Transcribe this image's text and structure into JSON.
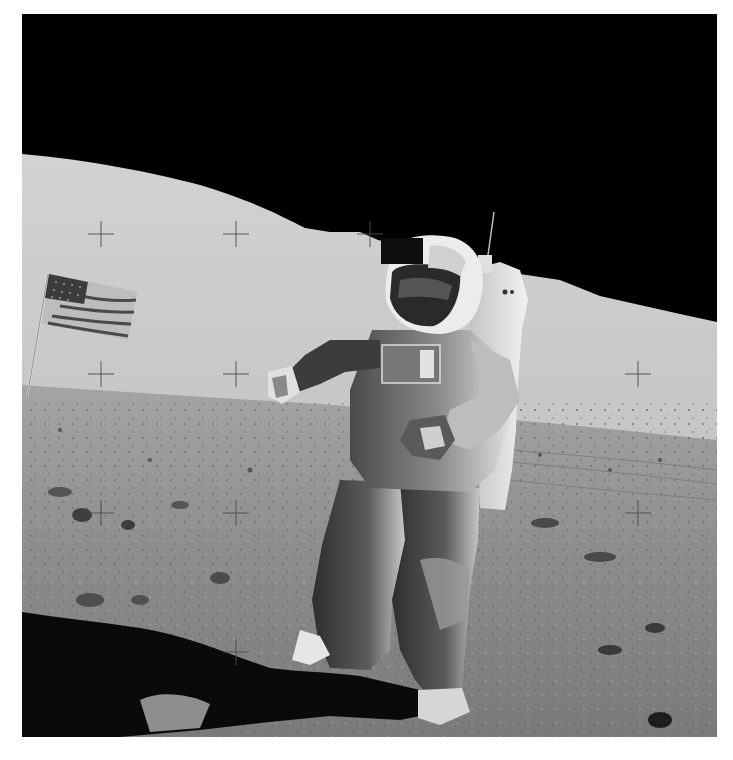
{
  "image": {
    "subject": "Astronaut on lunar surface",
    "description": "Black-and-white photograph of an astronaut in a spacesuit with backpack standing on the Moon, an American flag on a pole to the left, hills on the horizon, black sky, reseau crosshair marks across the frame",
    "frame": {
      "x": 22,
      "y": 14,
      "width": 695,
      "height": 723,
      "border_color": "#ffffff"
    },
    "colors": {
      "sky": "#000000",
      "hill_light": "#cfcfcf",
      "hill_mid": "#b8b8b8",
      "ground": "#8a8a8a",
      "ground_dark": "#5e5e5e",
      "shadow": "#0a0a0a",
      "suit_light": "#e8e8e8",
      "suit_mid": "#9a9a9a",
      "suit_dark": "#3a3a3a",
      "crosshair": "#4a4a4a"
    },
    "crosshairs": [
      {
        "x": 101,
        "y": 234
      },
      {
        "x": 236,
        "y": 234
      },
      {
        "x": 370,
        "y": 234
      },
      {
        "x": 101,
        "y": 374
      },
      {
        "x": 236,
        "y": 374
      },
      {
        "x": 638,
        "y": 374
      },
      {
        "x": 101,
        "y": 513
      },
      {
        "x": 236,
        "y": 513
      },
      {
        "x": 638,
        "y": 513
      },
      {
        "x": 236,
        "y": 652
      }
    ],
    "elements": [
      "sky",
      "lunar-hills",
      "lunar-ground",
      "american-flag",
      "astronaut",
      "backpack",
      "shadow",
      "crosshairs"
    ]
  }
}
